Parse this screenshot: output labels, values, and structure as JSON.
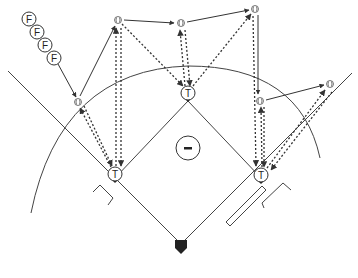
{
  "diagram": {
    "colors": {
      "line": "#333333",
      "fill": "#ffffff",
      "plate": "#222222"
    },
    "labels": {
      "fielder": "F",
      "thrower": "T",
      "pitcher": "-"
    },
    "fielders_queue": [
      {
        "label": "F",
        "x": 29,
        "y": 19
      },
      {
        "label": "F",
        "x": 37,
        "y": 32
      },
      {
        "label": "F",
        "x": 45,
        "y": 45
      },
      {
        "label": "F",
        "x": 54,
        "y": 58
      }
    ],
    "throwers": [
      {
        "id": "third-base",
        "label": "T",
        "x": 115,
        "y": 174
      },
      {
        "id": "second-base",
        "label": "T",
        "x": 188,
        "y": 93
      },
      {
        "id": "first-base",
        "label": "T",
        "x": 261,
        "y": 175
      }
    ],
    "pitcher": {
      "label": "-",
      "x": 188,
      "y": 148
    },
    "home_plate": {
      "x": 181,
      "y": 246
    },
    "balls": [
      {
        "id": "b1",
        "x": 78,
        "y": 102
      },
      {
        "id": "b2",
        "x": 118,
        "y": 20
      },
      {
        "id": "b3",
        "x": 181,
        "y": 23
      },
      {
        "id": "b4",
        "x": 255,
        "y": 9
      },
      {
        "id": "b5",
        "x": 260,
        "y": 101
      },
      {
        "id": "b6",
        "x": 330,
        "y": 84
      }
    ],
    "run_paths": [
      {
        "from": [
          58,
          64
        ],
        "to": [
          76,
          97
        ]
      },
      {
        "from": [
          80,
          96
        ],
        "to": [
          115,
          26
        ]
      },
      {
        "from": [
          124,
          20
        ],
        "to": [
          174,
          23
        ]
      },
      {
        "from": [
          187,
          22
        ],
        "to": [
          249,
          10
        ]
      },
      {
        "from": [
          255,
          15
        ],
        "to": [
          258,
          94
        ]
      },
      {
        "from": [
          266,
          100
        ],
        "to": [
          324,
          85
        ]
      }
    ]
  }
}
